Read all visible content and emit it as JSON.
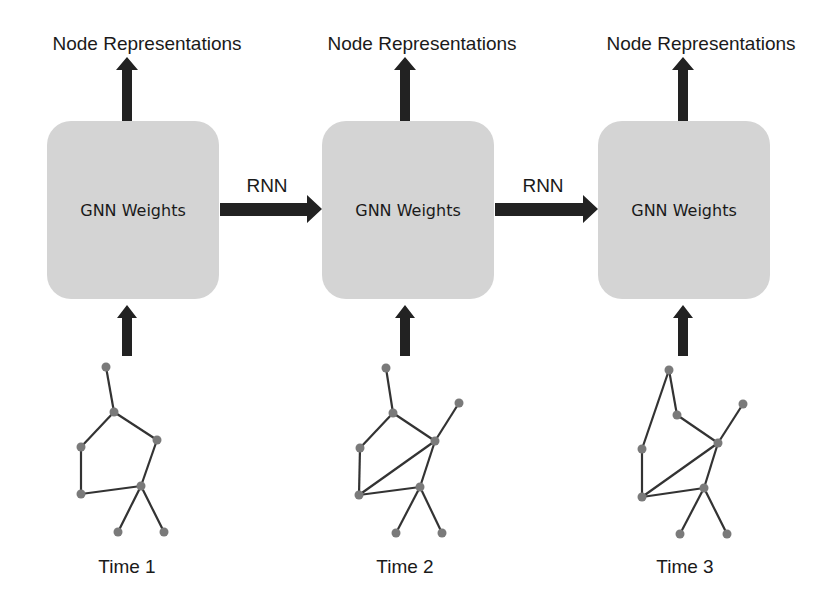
{
  "diagram": {
    "colors": {
      "box_fill": "#d4d4d4",
      "arrow": "#222222",
      "edge": "#333333",
      "node": "#7a7a7a",
      "text": "#1a1a1a"
    },
    "columns": [
      {
        "output_label": "Node Representations",
        "box_label": "GNN Weights",
        "time_label": "Time 1"
      },
      {
        "output_label": "Node Representations",
        "box_label": "GNN Weights",
        "time_label": "Time 2"
      },
      {
        "output_label": "Node Representations",
        "box_label": "GNN Weights",
        "time_label": "Time 3"
      }
    ],
    "transitions": [
      {
        "label": "RNN",
        "from": "Time 1",
        "to": "Time 2"
      },
      {
        "label": "RNN",
        "from": "Time 2",
        "to": "Time 3"
      }
    ],
    "graphs": [
      {
        "time": "Time 1",
        "nodes": [
          [
            106,
            367
          ],
          [
            114,
            412
          ],
          [
            157,
            440
          ],
          [
            81,
            447
          ],
          [
            141,
            486
          ],
          [
            81,
            494
          ],
          [
            118,
            532
          ],
          [
            164,
            532
          ]
        ],
        "edges": [
          [
            0,
            1
          ],
          [
            1,
            2
          ],
          [
            1,
            3
          ],
          [
            3,
            5
          ],
          [
            2,
            4
          ],
          [
            5,
            4
          ],
          [
            4,
            6
          ],
          [
            4,
            7
          ]
        ]
      },
      {
        "time": "Time 2",
        "nodes": [
          [
            386,
            368
          ],
          [
            393,
            413
          ],
          [
            435,
            441
          ],
          [
            459,
            403
          ],
          [
            360,
            448
          ],
          [
            420,
            487
          ],
          [
            359,
            495
          ],
          [
            396,
            533
          ],
          [
            442,
            533
          ]
        ],
        "edges": [
          [
            0,
            1
          ],
          [
            1,
            2
          ],
          [
            1,
            4
          ],
          [
            3,
            2
          ],
          [
            4,
            6
          ],
          [
            2,
            6
          ],
          [
            2,
            5
          ],
          [
            6,
            5
          ],
          [
            5,
            7
          ],
          [
            5,
            8
          ]
        ]
      },
      {
        "time": "Time 3",
        "nodes": [
          [
            669,
            370
          ],
          [
            677,
            415
          ],
          [
            718,
            443
          ],
          [
            743,
            404
          ],
          [
            642,
            449
          ],
          [
            704,
            488
          ],
          [
            642,
            497
          ],
          [
            680,
            534
          ],
          [
            727,
            534
          ]
        ],
        "edges": [
          [
            0,
            1
          ],
          [
            0,
            4
          ],
          [
            1,
            2
          ],
          [
            3,
            2
          ],
          [
            4,
            6
          ],
          [
            2,
            6
          ],
          [
            2,
            5
          ],
          [
            6,
            5
          ],
          [
            5,
            7
          ],
          [
            5,
            8
          ]
        ]
      }
    ]
  }
}
